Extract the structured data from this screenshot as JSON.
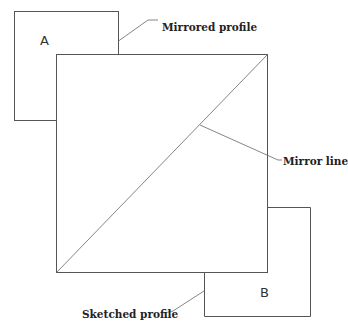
{
  "diagram": {
    "labels": {
      "profile_a": "A",
      "profile_b": "B",
      "mirrored_profile": "Mirrored profile",
      "mirror_line": "Mirror line",
      "sketched_profile": "Sketched profile"
    },
    "colors": {
      "stroke": "#555555",
      "text": "#222222",
      "background": "#ffffff"
    }
  }
}
